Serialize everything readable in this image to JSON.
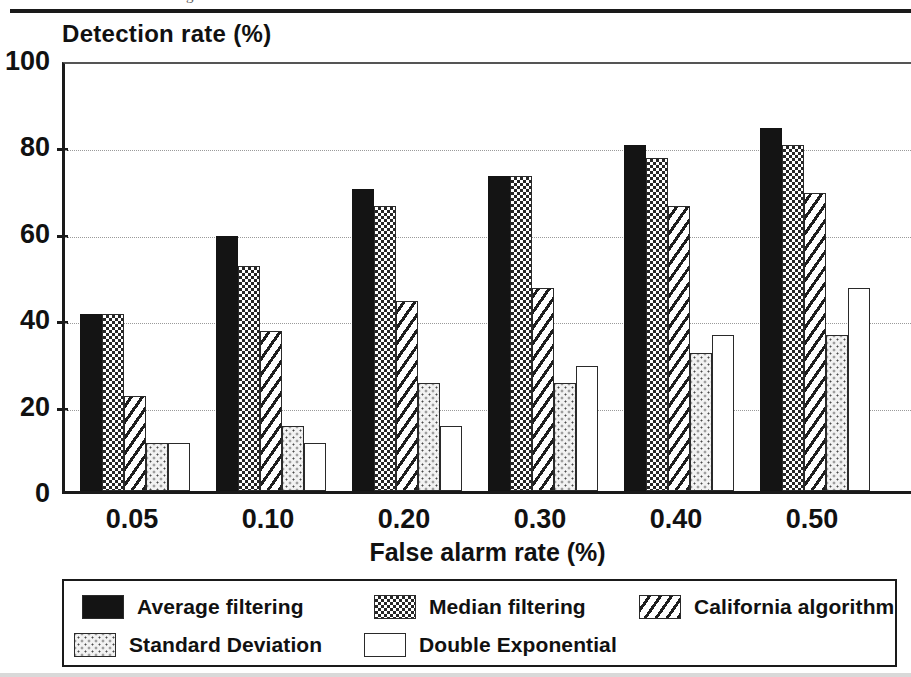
{
  "figure": {
    "caption_remnant": "g                    1",
    "y_axis_title": "Detection rate (%)",
    "x_axis_title": "False alarm rate (%)"
  },
  "chart_data": {
    "type": "bar",
    "title": "",
    "xlabel": "False alarm rate (%)",
    "ylabel": "Detection rate (%)",
    "ylim": [
      0,
      100
    ],
    "yticks": [
      0,
      20,
      40,
      60,
      80,
      100
    ],
    "ytick_labels": [
      "0",
      "20",
      "40",
      "60",
      "80",
      "100"
    ],
    "grid": "horizontal-dotted",
    "legend_position": "below-plot",
    "categories": [
      "0.05",
      "0.10",
      "0.20",
      "0.30",
      "0.40",
      "0.50"
    ],
    "series": [
      {
        "name": "Average filtering",
        "pattern": "solid-black",
        "values": [
          41,
          59,
          70,
          73,
          80,
          84
        ]
      },
      {
        "name": "Median filtering",
        "pattern": "checkerboard",
        "values": [
          41,
          52,
          66,
          73,
          77,
          80
        ]
      },
      {
        "name": "California algorithm",
        "pattern": "diagonal-hatch",
        "values": [
          22,
          37,
          44,
          47,
          66,
          69
        ]
      },
      {
        "name": "Standard Deviation",
        "pattern": "light-stipple",
        "values": [
          11,
          15,
          25,
          25,
          32,
          36
        ]
      },
      {
        "name": "Double Exponential",
        "pattern": "white",
        "values": [
          11,
          11,
          15,
          29,
          36,
          47
        ]
      }
    ]
  },
  "legend": {
    "entries": [
      {
        "label": "Average filtering",
        "pattern": "solid-black"
      },
      {
        "label": "Median filtering",
        "pattern": "checkerboard"
      },
      {
        "label": "California algorithm",
        "pattern": "diagonal-hatch"
      },
      {
        "label": "Standard Deviation",
        "pattern": "light-stipple"
      },
      {
        "label": "Double Exponential",
        "pattern": "white"
      }
    ]
  },
  "colors": {
    "ink": "#141414",
    "grid": "#9a9a9a",
    "paper": "#ffffff"
  }
}
